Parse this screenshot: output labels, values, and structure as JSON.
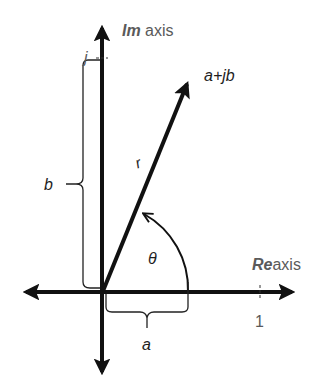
{
  "diagram": {
    "labels": {
      "im_axis_bold": "Im",
      "im_axis_text": " axis",
      "re_axis_bold": "Re",
      "re_axis_text": "axis",
      "imag_unit": "j",
      "real_unit": "1",
      "point": "a+jb",
      "magnitude": "r",
      "angle": "θ",
      "real_part": "a",
      "imag_part": "b"
    },
    "colors": {
      "stroke": "#111111",
      "axis_label": "#5a5a5a",
      "text": "#1e1e1e",
      "background": "#ffffff"
    }
  }
}
